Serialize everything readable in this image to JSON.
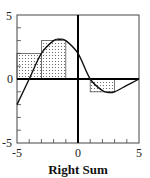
{
  "chart_data": {
    "type": "area",
    "title": "",
    "xlabel": "Right Sum",
    "ylabel": "",
    "xlim": [
      -5,
      5
    ],
    "ylim": [
      -5,
      5
    ],
    "x_tick_labels": [
      "-5",
      "0",
      "5"
    ],
    "y_tick_labels": [
      "-5",
      "0",
      "5"
    ],
    "grid": false,
    "curve": {
      "name": "f(x)",
      "x": [
        -5,
        -4,
        -3,
        -2,
        -1.5,
        -1,
        0,
        1,
        2,
        2.5,
        3,
        4,
        5
      ],
      "y": [
        -2,
        0,
        2,
        3,
        3.1,
        3,
        2,
        0,
        -0.9,
        -1.05,
        -1,
        -0.5,
        0
      ]
    },
    "rectangles": [
      {
        "x0": -5,
        "x1": -3,
        "height": 2
      },
      {
        "x0": -3,
        "x1": -1,
        "height": 3
      },
      {
        "x0": -1,
        "x1": 1,
        "height": 0
      },
      {
        "x0": 1,
        "x1": 3,
        "height": -1
      },
      {
        "x0": 3,
        "x1": 5,
        "height": 0
      }
    ],
    "method": "Right Sum",
    "delta_x": 2,
    "colors": {
      "curve": "#111111",
      "frame": "#333333",
      "fill_dots": "#555555"
    }
  }
}
